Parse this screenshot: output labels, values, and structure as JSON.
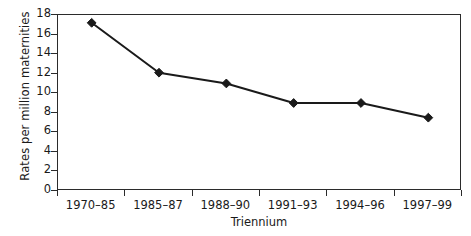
{
  "chart_data": {
    "type": "line",
    "title": "",
    "subtitle": "",
    "xlabel": "Triennium",
    "ylabel": "Rates per million maternities",
    "categories": [
      "1970–85",
      "1985–87",
      "1988–90",
      "1991–93",
      "1994–96",
      "1997–99"
    ],
    "values": [
      17.2,
      12.1,
      11.0,
      9.0,
      9.0,
      7.5
    ],
    "series": [
      {
        "name": "Rates per million maternities",
        "values": [
          17.2,
          12.1,
          11.0,
          9.0,
          9.0,
          7.5
        ]
      }
    ],
    "ylim": [
      0,
      18
    ],
    "yticks": [
      0,
      2,
      4,
      6,
      8,
      10,
      12,
      14,
      16,
      18
    ],
    "ytick_labels": [
      "0",
      "2",
      "4",
      "6",
      "8",
      "10",
      "12",
      "14",
      "16",
      "18"
    ],
    "grid": false,
    "legend": false,
    "legend_position": "none",
    "marker": "diamond",
    "line_color": "#1a1a1a",
    "marker_color": "#1a1a1a",
    "background_color": "#ffffff",
    "axis_color": "#2b2b2b"
  },
  "axes": {
    "y_title": "Rates per million maternities",
    "x_title": "Triennium",
    "y_tick_labels": [
      "18",
      "16",
      "14",
      "12",
      "10",
      "8",
      "6",
      "4",
      "2",
      "0"
    ],
    "x_tick_labels": [
      "1970–85",
      "1985–87",
      "1988–90",
      "1991–93",
      "1994–96",
      "1997–99"
    ]
  }
}
